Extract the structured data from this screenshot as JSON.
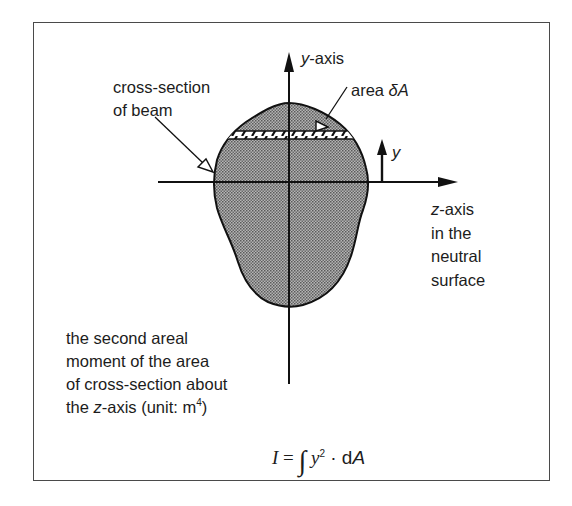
{
  "figure": {
    "labels": {
      "y_axis": {
        "var": "y",
        "suffix": "-axis"
      },
      "cross_section": [
        "cross-section",
        "of beam"
      ],
      "area": {
        "prefix": "area ",
        "symbol": "δA"
      },
      "y_distance": "y",
      "z_axis": {
        "var": "z",
        "suffix": "-axis",
        "lines": [
          "in the",
          "neutral",
          "surface"
        ]
      },
      "description": {
        "lines": [
          "the second areal",
          "moment of the area",
          "of cross-section about"
        ],
        "last_line": {
          "prefix": "the ",
          "var": "z",
          "middle": "-axis (unit: m",
          "exponent": "4",
          "suffix": ")"
        }
      },
      "formula": {
        "lhs": "I",
        "equals": " = ",
        "integral": "∫",
        "var": "y",
        "exponent": "2",
        "dot": " · ",
        "d": "d",
        "A": "A"
      }
    },
    "colors": {
      "frame": "#4a4a4a",
      "line": "#111111",
      "shape_fill": "#8f8f8f",
      "hatch_bg": "#ffffff"
    }
  }
}
